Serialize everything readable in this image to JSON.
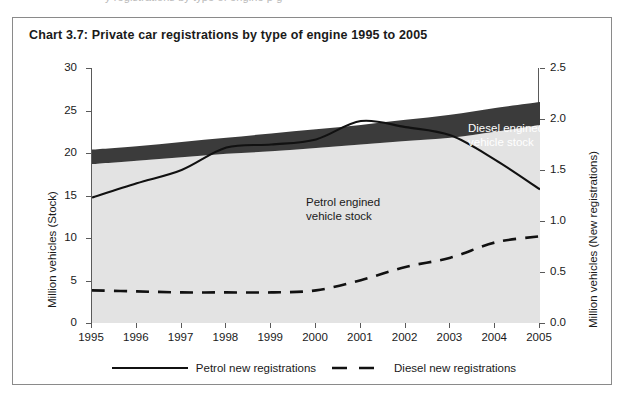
{
  "page": {
    "clipped_header_text": "y    registrations  by  type  of  engine          p                                    g"
  },
  "chart_frame": {
    "title": "Chart 3.7:  Private car registrations by type of engine 1995 to 2005"
  },
  "axes": {
    "left_title": "Million vehicles (Stock)",
    "right_title": "Million vehicles (New registrations)",
    "left_ticks": [
      "30",
      "25",
      "20",
      "15",
      "10",
      "5",
      "0"
    ],
    "right_ticks": [
      "2.5",
      "2.0",
      "1.5",
      "1.0",
      "0.5",
      "0.0"
    ],
    "x_ticks": [
      "1995",
      "1996",
      "1997",
      "1998",
      "1999",
      "2000",
      "2001",
      "2002",
      "2003",
      "2004",
      "2005"
    ]
  },
  "annotations": {
    "diesel_stock_line1": "Diesel engined",
    "diesel_stock_line2": "vehicle stock",
    "petrol_stock_line1": "Petrol engined",
    "petrol_stock_line2": "vehicle stock"
  },
  "legend": {
    "petrol_label": "Petrol new registrations",
    "diesel_label": "Diesel new registrations"
  },
  "colors": {
    "petrol_stock_fill": "#e3e3e3",
    "diesel_stock_fill": "#3b3b3b",
    "line_color": "#111111",
    "axis_color": "#5a5a5a",
    "frame_border": "#8a8a8a",
    "plot_background": "#ffffff"
  },
  "chart_data": {
    "type": "area",
    "title": "Chart 3.7:  Private car registrations by type of engine 1995 to 2005",
    "xlabel": "",
    "ylabel": "Million vehicles (Stock)",
    "y2label": "Million vehicles (New registrations)",
    "x": [
      1995,
      1996,
      1997,
      1998,
      1999,
      2000,
      2001,
      2002,
      2003,
      2004,
      2005
    ],
    "categories": [
      "1995",
      "1996",
      "1997",
      "1998",
      "1999",
      "2000",
      "2001",
      "2002",
      "2003",
      "2004",
      "2005"
    ],
    "ylim": [
      0,
      30
    ],
    "y2lim": [
      0,
      2.5
    ],
    "ytick_step": 5,
    "y2tick_step": 0.5,
    "grid": false,
    "legend_position": "bottom",
    "stacked_areas": [
      {
        "name": "Petrol engined vehicle stock",
        "axis": "left",
        "fill": "#e3e3e3",
        "values": [
          18.7,
          19.1,
          19.5,
          19.9,
          20.2,
          20.6,
          21.0,
          21.4,
          21.8,
          22.5,
          23.3
        ]
      },
      {
        "name": "Diesel engined vehicle stock",
        "axis": "left",
        "fill": "#3b3b3b",
        "cumulative_top": [
          20.4,
          20.8,
          21.3,
          21.8,
          22.3,
          22.8,
          23.3,
          23.9,
          24.5,
          25.3,
          26.0
        ],
        "values": [
          1.7,
          1.7,
          1.8,
          1.9,
          2.1,
          2.2,
          2.3,
          2.5,
          2.7,
          2.8,
          2.7
        ]
      }
    ],
    "series": [
      {
        "name": "Petrol new registrations",
        "axis": "right",
        "style": "solid",
        "color": "#111111",
        "values": [
          1.23,
          1.37,
          1.5,
          1.72,
          1.75,
          1.8,
          1.98,
          1.92,
          1.84,
          1.6,
          1.31
        ]
      },
      {
        "name": "Diesel new registrations",
        "axis": "right",
        "style": "dashed",
        "color": "#111111",
        "values": [
          0.32,
          0.31,
          0.3,
          0.3,
          0.3,
          0.32,
          0.42,
          0.55,
          0.64,
          0.79,
          0.85
        ]
      }
    ]
  }
}
